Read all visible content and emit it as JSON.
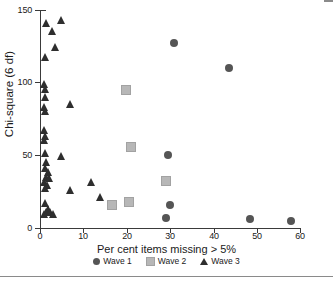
{
  "figure": {
    "title": "",
    "background": "#ffffff"
  },
  "axes": {
    "x_title": "Per cent items missing > 5%",
    "y_title": "Chi-square (6 df)",
    "x_ticks": [
      0,
      10,
      20,
      30,
      40,
      50,
      60
    ],
    "y_ticks": [
      0,
      50,
      100,
      150
    ],
    "xlim": [
      0,
      60
    ],
    "ylim": [
      0,
      150
    ]
  },
  "legend": {
    "position": "bottom-center",
    "entries": [
      {
        "label": "Wave 1",
        "marker": "circle",
        "color": "#555555"
      },
      {
        "label": "Wave 2",
        "marker": "square",
        "color": "#b7b7b7"
      },
      {
        "label": "Wave 3",
        "marker": "triangle",
        "color": "#2e2e2e"
      }
    ]
  },
  "neighbor_panel": {
    "y_title": "Chi-square"
  },
  "chart_data": {
    "type": "scatter",
    "title": "",
    "xlabel": "Per cent items missing > 5%",
    "ylabel": "Chi-square (6 df)",
    "xlim": [
      0,
      60
    ],
    "ylim": [
      0,
      150
    ],
    "xticks": [
      0,
      10,
      20,
      30,
      40,
      50,
      60
    ],
    "yticks": [
      0,
      50,
      100,
      150
    ],
    "grid": false,
    "legend_position": "bottom-center",
    "series": [
      {
        "name": "Wave 1",
        "marker": "circle",
        "color": "#555555",
        "points": [
          [
            31,
            127
          ],
          [
            43.6,
            110
          ],
          [
            29.5,
            50
          ],
          [
            30,
            16
          ],
          [
            29,
            7
          ],
          [
            48.5,
            6
          ],
          [
            58,
            5
          ]
        ]
      },
      {
        "name": "Wave 2",
        "marker": "square",
        "color": "#b7b7b7",
        "points": [
          [
            19.8,
            95
          ],
          [
            21,
            56
          ],
          [
            29,
            32
          ],
          [
            20.5,
            18
          ],
          [
            16.5,
            15.5
          ]
        ]
      },
      {
        "name": "Wave 3",
        "marker": "triangle",
        "color": "#2e2e2e",
        "points": [
          [
            1.5,
            141
          ],
          [
            5,
            143
          ],
          [
            3,
            135
          ],
          [
            3.5,
            124
          ],
          [
            1.2,
            117
          ],
          [
            1.0,
            99
          ],
          [
            1.2,
            95
          ],
          [
            1.3,
            90
          ],
          [
            1.1,
            83
          ],
          [
            1.4,
            80
          ],
          [
            7,
            85
          ],
          [
            1.0,
            67
          ],
          [
            1.3,
            63
          ],
          [
            1.1,
            60
          ],
          [
            1.2,
            51
          ],
          [
            5,
            49
          ],
          [
            1.5,
            45
          ],
          [
            1.4,
            41
          ],
          [
            2.0,
            38
          ],
          [
            1.6,
            35
          ],
          [
            2.2,
            34
          ],
          [
            1.1,
            31
          ],
          [
            1.8,
            29
          ],
          [
            1.3,
            27
          ],
          [
            12,
            31
          ],
          [
            7,
            26
          ],
          [
            14,
            21
          ],
          [
            1.2,
            17
          ],
          [
            2.0,
            13
          ],
          [
            1.5,
            11
          ],
          [
            2.4,
            11
          ],
          [
            3.2,
            9
          ],
          [
            1.0,
            9
          ]
        ]
      }
    ]
  }
}
